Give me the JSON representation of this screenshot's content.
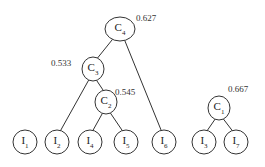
{
  "diagram": {
    "type": "hierarchical-cluster-tree",
    "clusters": [
      {
        "id": "C4",
        "letter": "C",
        "sub": "4",
        "score": "0.627",
        "x": 120,
        "y": 29,
        "rx": 15,
        "ry": 12,
        "score_x": 136,
        "score_y": 13,
        "children": [
          "C3",
          "I6"
        ]
      },
      {
        "id": "C3",
        "letter": "C",
        "sub": "3",
        "score": "0.533",
        "x": 93,
        "y": 69,
        "rx": 11,
        "ry": 12,
        "score_x": 51,
        "score_y": 58,
        "children": [
          "I2",
          "C2"
        ]
      },
      {
        "id": "C2",
        "letter": "C",
        "sub": "2",
        "score": "0.545",
        "x": 106,
        "y": 102,
        "rx": 11,
        "ry": 12,
        "score_x": 115,
        "score_y": 87,
        "children": [
          "I4",
          "I5"
        ]
      },
      {
        "id": "C1",
        "letter": "C",
        "sub": "1",
        "score": "0.667",
        "x": 219,
        "y": 108,
        "rx": 11,
        "ry": 12,
        "score_x": 228,
        "score_y": 84,
        "children": [
          "I3",
          "I7"
        ]
      }
    ],
    "items": [
      {
        "id": "I1",
        "letter": "I",
        "sub": "1",
        "x": 25,
        "y": 142
      },
      {
        "id": "I2",
        "letter": "I",
        "sub": "2",
        "x": 57,
        "y": 142
      },
      {
        "id": "I4",
        "letter": "I",
        "sub": "4",
        "x": 90,
        "y": 142
      },
      {
        "id": "I5",
        "letter": "I",
        "sub": "5",
        "x": 126,
        "y": 142
      },
      {
        "id": "I6",
        "letter": "I",
        "sub": "6",
        "x": 164,
        "y": 142
      },
      {
        "id": "I3",
        "letter": "I",
        "sub": "3",
        "x": 204,
        "y": 142
      },
      {
        "id": "I7",
        "letter": "I",
        "sub": "7",
        "x": 236,
        "y": 142
      }
    ],
    "item_radius": 12,
    "stroke_color": "#333333"
  }
}
